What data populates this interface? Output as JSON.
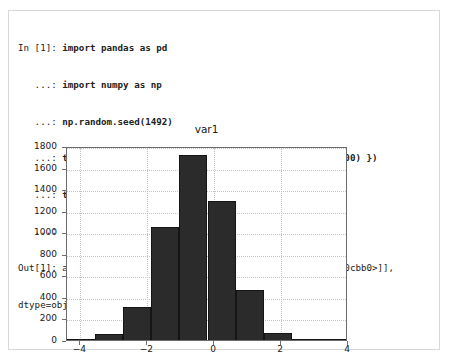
{
  "cell": {
    "code_lines": [
      {
        "prompt": "In [1]: ",
        "text": "import pandas as pd"
      },
      {
        "prompt": "   ...: ",
        "text": "import numpy as np"
      },
      {
        "prompt": "   ...: ",
        "text": "np.random.seed(1492)"
      },
      {
        "prompt": "   ...: ",
        "text": "test_df = pd.DataFrame({ \"var1\": np.random.randn(5000) })"
      },
      {
        "prompt": "   ...: ",
        "text": "test_df.hist()"
      },
      {
        "prompt": "   ...: ",
        "text": ""
      }
    ],
    "output_lines": [
      {
        "prompt": "Out[1]: ",
        "text": "array([[<matplotlib.axes.AxesSubplot object at 0x7e0cbb0>]],"
      },
      {
        "prompt": "",
        "text": "dtype=object)"
      }
    ]
  },
  "chart_data": {
    "type": "bar",
    "title": "var1",
    "xlabel": "",
    "ylabel": "",
    "bin_count": 10,
    "sample_size": 5000,
    "grid": true,
    "legend": false,
    "xlim": [
      -4.4,
      4.0
    ],
    "ylim": [
      0,
      1800
    ],
    "yticks": [
      0,
      200,
      400,
      600,
      800,
      1000,
      1200,
      1400,
      1600,
      1800
    ],
    "ytick_labels": [
      "0",
      "200",
      "400",
      "600",
      "800",
      "1000",
      "1200",
      "1400",
      "1600",
      "1800"
    ],
    "xticks": [
      -4,
      -2,
      0,
      2,
      4
    ],
    "xtick_labels": [
      "−4",
      "−2",
      "0",
      "2",
      "4"
    ],
    "bin_edges": [
      -4.4,
      -3.56,
      -2.72,
      -1.88,
      -1.04,
      -0.2,
      0.64,
      1.48,
      2.32,
      3.16,
      4.0
    ],
    "values": [
      10,
      60,
      310,
      1050,
      1720,
      1290,
      465,
      65,
      8,
      2
    ],
    "bar_color": "#2b2b2b",
    "edge_color": "#151515"
  }
}
